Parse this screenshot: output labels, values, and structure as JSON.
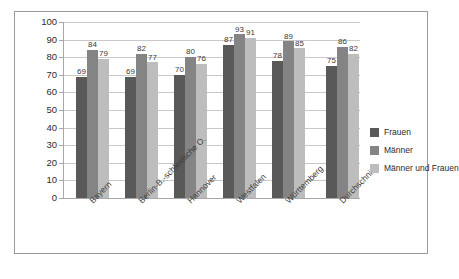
{
  "chart_data": {
    "type": "bar",
    "title": "",
    "subtitle": "",
    "xlabel": "",
    "ylabel": "",
    "ylim": [
      0,
      100
    ],
    "ytick_step": 10,
    "yticks": [
      100,
      90,
      80,
      70,
      60,
      50,
      40,
      30,
      20,
      10,
      0
    ],
    "grid": true,
    "legend_position": "right",
    "categories": [
      "Bayern",
      "Berlin-B.-schlesische O.",
      "Hannover",
      "Westfalen",
      "Württemberg",
      "Durchschnitt"
    ],
    "series": [
      {
        "name": "Frauen",
        "color": "#595959",
        "values": [
          69,
          69,
          70,
          87,
          78,
          75
        ]
      },
      {
        "name": "Männer",
        "color": "#848484",
        "values": [
          84,
          82,
          80,
          93,
          89,
          86
        ]
      },
      {
        "name": "Männer und Frauen",
        "color": "#bdbdbd",
        "values": [
          79,
          77,
          76,
          91,
          85,
          82
        ]
      }
    ],
    "data_labels": {
      "Bayern": [
        69,
        84,
        79
      ],
      "Berlin-B.-schlesische O.": [
        69,
        82,
        77
      ],
      "Hannover": [
        70,
        80,
        76
      ],
      "Westfalen": [
        87,
        93,
        91
      ],
      "Württemberg": [
        78,
        89,
        85
      ],
      "Durchschnitt": [
        75,
        86,
        82
      ]
    }
  },
  "legend": {
    "items": [
      {
        "label": "Frauen",
        "color": "#595959"
      },
      {
        "label": "Männer",
        "color": "#848484"
      },
      {
        "label": "Männer und Frauen",
        "color": "#bdbdbd"
      }
    ]
  }
}
